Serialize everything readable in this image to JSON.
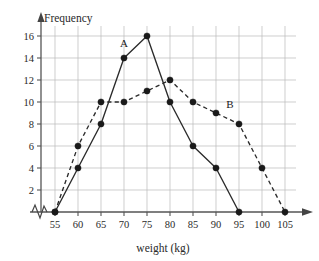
{
  "chart_data": {
    "type": "line",
    "title": "",
    "xlabel": "weight (kg)",
    "ylabel": "Frequency",
    "grid": true,
    "legend_position": "inline-annotation",
    "x": [
      55,
      60,
      65,
      70,
      75,
      80,
      85,
      90,
      95,
      100,
      105
    ],
    "xtick_labels": [
      "55",
      "60",
      "65",
      "70",
      "75",
      "80",
      "85",
      "90",
      "95",
      "100",
      "105"
    ],
    "ytick_labels": [
      "2",
      "4",
      "6",
      "8",
      "10",
      "12",
      "14",
      "16"
    ],
    "ytick_values": [
      2,
      4,
      6,
      8,
      10,
      12,
      14,
      16
    ],
    "xlim": [
      55,
      105
    ],
    "ylim": [
      0,
      16
    ],
    "x_axis_break": true,
    "series": [
      {
        "name": "A",
        "style": "solid",
        "label": "A",
        "label_x": 70,
        "label_y": 15,
        "points": [
          {
            "x": 55,
            "y": 0
          },
          {
            "x": 60,
            "y": 4
          },
          {
            "x": 65,
            "y": 8
          },
          {
            "x": 70,
            "y": 14
          },
          {
            "x": 75,
            "y": 16
          },
          {
            "x": 80,
            "y": 10
          },
          {
            "x": 85,
            "y": 6
          },
          {
            "x": 90,
            "y": 4
          },
          {
            "x": 95,
            "y": 0
          }
        ]
      },
      {
        "name": "B",
        "style": "dashed",
        "label": "B",
        "label_x": 93,
        "label_y": 9.5,
        "points": [
          {
            "x": 55,
            "y": 0
          },
          {
            "x": 60,
            "y": 6
          },
          {
            "x": 65,
            "y": 10
          },
          {
            "x": 70,
            "y": 10
          },
          {
            "x": 75,
            "y": 11
          },
          {
            "x": 80,
            "y": 12
          },
          {
            "x": 85,
            "y": 10
          },
          {
            "x": 90,
            "y": 9
          },
          {
            "x": 95,
            "y": 8
          },
          {
            "x": 100,
            "y": 4
          },
          {
            "x": 105,
            "y": 0
          }
        ]
      }
    ],
    "colors": {
      "grid": "#b9b9b9",
      "axis": "#555555",
      "series": "#2b2b2b",
      "marker": "#1a1a1a",
      "background": "#ffffff"
    }
  }
}
